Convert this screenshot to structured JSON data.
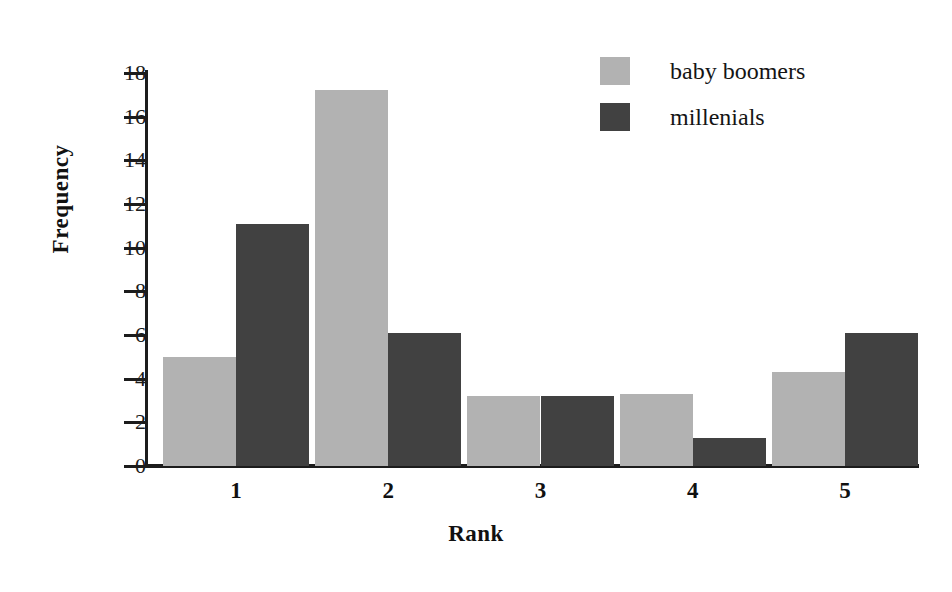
{
  "chart_data": {
    "type": "bar",
    "title": "",
    "xlabel": "Rank",
    "ylabel": "Frequency",
    "categories": [
      "1",
      "2",
      "3",
      "4",
      "5"
    ],
    "series": [
      {
        "name": "baby boomers",
        "color": "#b2b2b2",
        "values": [
          5.0,
          17.2,
          3.2,
          3.3,
          4.3
        ]
      },
      {
        "name": "millenials",
        "color": "#414141",
        "values": [
          11.1,
          6.1,
          3.2,
          1.3,
          6.1
        ]
      }
    ],
    "ylim": [
      0,
      18
    ],
    "ytick_values": [
      0,
      2,
      4,
      6,
      8,
      10,
      12,
      14,
      16,
      18
    ],
    "ytick_labels": [
      "0",
      "2",
      "4",
      "6",
      "8",
      "10",
      "12",
      "14",
      "16",
      "18"
    ],
    "grid": false,
    "legend_position": "top-right"
  },
  "legend": {
    "entries": [
      {
        "label": "baby boomers",
        "swatch": "light"
      },
      {
        "label": "millenials",
        "swatch": "dark"
      }
    ]
  },
  "axes": {
    "y_title": "Frequency",
    "x_title": "Rank"
  },
  "colors": {
    "light_gray": "#b2b2b2",
    "dark_gray": "#414141",
    "axis": "#1c1c1c",
    "background": "#ffffff"
  }
}
